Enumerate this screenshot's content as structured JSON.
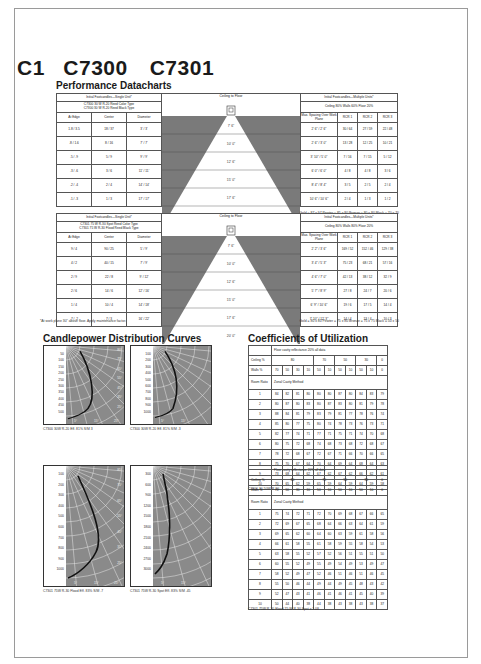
{
  "header": {
    "section": "C1",
    "model1": "C7300",
    "model2": "C7301"
  },
  "performance": {
    "title": "Performance Datacharts",
    "tables": [
      {
        "single_title": "Initial Footcandles—Single Unit*",
        "lamp_line1": "C7300  30 W R-20 Reed Color Type",
        "lamp_line2": "C7300  30 W R-20 Reed Black Type",
        "col_edge": "At Edge",
        "col_center": "Center",
        "col_diameter": "Diameter",
        "ceiling_title": "Ceiling to Floor",
        "multi_title": "Initial Footcandles—Multiple Units*",
        "multi_sub": "Ceiling 80%   Walls 60%   Floor 20%",
        "col_spacing": "Max. Spacing Over Work Plane",
        "col_rcr1": "RCR 1",
        "col_rcr2": "RCR 2",
        "col_rcr3": "RCR 3",
        "rows": [
          {
            "edge": "1.8 / 3.5",
            "center": "18 / 37",
            "diameter": "3' / 3'",
            "height": "7' 6\"",
            "spacing": "2' 6\" / 2' 6\"",
            "rcr1": "30 / 64",
            "rcr2": "27 / 59",
            "rcr3": "22 / 48"
          },
          {
            "edge": ".8 / 1.6",
            "center": "8 / 16",
            "diameter": "7' / 7'",
            "height": "10' 0\"",
            "spacing": "2' 6\" / 3' 0\"",
            "rcr1": "13 / 28",
            "rcr2": "12 / 25",
            "rcr3": "10 / 21"
          },
          {
            "edge": ".5 / .9",
            "center": "5 / 9",
            "diameter": "9' / 9'",
            "height": "12' 6\"",
            "spacing": "3' 10\" / 5' 0\"",
            "rcr1": "7 / 16",
            "rcr2": "7 / 15",
            "rcr3": "5 / 12"
          },
          {
            "edge": ".3 / .6",
            "center": "3 / 6",
            "diameter": "11' / 11'",
            "height": "15' 0\"",
            "spacing": "6' 0\" / 6' 0\"",
            "rcr1": "4 / 8",
            "rcr2": "4 / 8",
            "rcr3": "3 / 6"
          },
          {
            "edge": ".2 / .4",
            "center": "2 / 4",
            "diameter": "14' / 14'",
            "height": "17' 6\"",
            "spacing": "8' 4\" / 8' 4\"",
            "rcr1": "3 / 5",
            "rcr2": "2 / 5",
            "rcr3": "2 / 4"
          },
          {
            "edge": ".1 / .3",
            "center": "1 / 3",
            "diameter": "17' / 17'",
            "height": "20' 0\"",
            "spacing": "10' 6\" / 10' 6\"",
            "rcr1": "2 / 4",
            "rcr2": "1 / 3",
            "rcr3": "1 / 2"
          }
        ],
        "footnote_right": "Gold = 87 x 97   Pewter = 85 x 80   Bronze = 80 x 80   Black = 70 x 70"
      },
      {
        "single_title": "Initial Footcandles—Single Unit*",
        "lamp_line1": "C7301  75 W R-30 Spot Reed Color Type",
        "lamp_line2": "C7301  75 W R-30 Flood Reed Black Type",
        "col_edge": "At Edge",
        "col_center": "Center",
        "col_diameter": "Diameter",
        "ceiling_title": "Ceiling to Floor",
        "multi_title": "Initial Footcandles—Multiple Units*",
        "multi_sub": "Ceiling 80%   Walls 80%   Floor 20%",
        "col_spacing": "Max. Spacing Over Work Plane",
        "col_rcr1": "RCR 1",
        "col_rcr2": "RCR 2",
        "col_rcr3": "RCR 3",
        "rows": [
          {
            "edge": "9 / 4",
            "center": "90 / 25",
            "diameter": "5' / 9'",
            "height": "7' 6\"",
            "spacing": "2' 2\" / 3' 6\"",
            "rcr1": "169 / 52",
            "rcr2": "152 / 46",
            "rcr3": "129 / 38"
          },
          {
            "edge": "4 / 2",
            "center": "40 / 15",
            "diameter": "7' / 9'",
            "height": "10' 0\"",
            "spacing": "3' 4\" / 5' 3\"",
            "rcr1": "75 / 23",
            "rcr2": "68 / 21",
            "rcr3": "57 / 16"
          },
          {
            "edge": "2 / 9",
            "center": "22 / 8",
            "diameter": "9' / 12'",
            "height": "12' 6\"",
            "spacing": "4' 6\" / 7' 0\"",
            "rcr1": "42 / 13",
            "rcr2": "38 / 12",
            "rcr3": "32 / 9"
          },
          {
            "edge": "2 / 6",
            "center": "14 / 6",
            "diameter": "12' / 16'",
            "height": "15' 0\"",
            "spacing": "5' 7\" / 8' 9\"",
            "rcr1": "27 / 8",
            "rcr2": "24 / 7",
            "rcr3": "20 / 6"
          },
          {
            "edge": "1 / 4",
            "center": "10 / 4",
            "diameter": "14' / 18'",
            "height": "17' 6\"",
            "spacing": "6' 9\" / 10' 6\"",
            "rcr1": "19 / 6",
            "rcr2": "17 / 5",
            "rcr3": "14 / 4"
          },
          {
            "edge": ".7 / .2",
            "center": "7 / 3",
            "diameter": "16' / 22'",
            "height": "20' 0\"",
            "spacing": "7' 10\" / 12' 3\"",
            "rcr1": "14 / 4",
            "rcr2": "13 / 4",
            "rcr3": "10 / 3"
          }
        ],
        "footnote_left": "*At work plane 30\" above floor.  Apply maintenance factor.",
        "footnote_right": "Gold = 80 x 80   Pewter = 75 x 80   Bronze = 75 x 75   Black = 50 x 50"
      }
    ]
  },
  "candlepower": {
    "title": "Candlepower Distribution Curves",
    "charts": [
      {
        "ticks": [
          "50",
          "100",
          "150",
          "200",
          "250",
          "300",
          "350",
          "400",
          "450",
          "500"
        ],
        "caption": "C7300   30W R-20   Eff. 81%   S/M 3",
        "angles": [
          "80°",
          "75°",
          "65°",
          "55°",
          "45°",
          "35°",
          "25°"
        ],
        "bottom": [
          "5°",
          "15°",
          "25°"
        ]
      },
      {
        "ticks": [
          "100",
          "200",
          "300",
          "400",
          "500",
          "600",
          "700",
          "800",
          "900",
          "1000"
        ],
        "caption": "C7300   30W R-20   Eff. 81%   S/M .3",
        "angles": [],
        "bottom": [
          "5°",
          "15°"
        ]
      },
      {
        "ticks": [
          "100",
          "200",
          "300",
          "400",
          "500",
          "600",
          "700",
          "800",
          "900",
          "1000"
        ],
        "caption": "C7301   75W R-30 Flood   Eff. 83%   S/M .7",
        "angles": [
          "85°",
          "75°",
          "65°",
          "55°",
          "45°",
          "35°",
          "25°"
        ],
        "bottom": [
          "5°",
          "15°",
          "25°"
        ]
      },
      {
        "ticks": [
          "300",
          "600",
          "900",
          "1200",
          "1500",
          "1800",
          "2100",
          "2400",
          "2700",
          "3000"
        ],
        "caption": "C7301   75W R-30 Spot   Eff. 83%   S/M .45",
        "angles": [],
        "bottom": [
          "5°",
          "15°"
        ]
      }
    ]
  },
  "cou": {
    "title": "Coefficients of Utilization",
    "floor_note": "Floor cavity reflectance 20% all data",
    "ceiling_label": "Ceiling %",
    "walls_label": "Walls %",
    "room_ratio_label": "Room Ratio",
    "method_label": "Zonal Cavity Method",
    "ceiling_values": [
      "80",
      "70",
      "50",
      "30",
      "0"
    ],
    "walls_values": [
      "70",
      "50",
      "30",
      "10",
      "50",
      "10",
      "50",
      "10",
      "50",
      "10",
      "0"
    ],
    "tables": [
      {
        "rows": [
          [
            "1",
            "84",
            "82",
            "81",
            "80",
            "80",
            "80",
            "87",
            "80",
            "84",
            "83",
            "79"
          ],
          [
            "2",
            "80",
            "87",
            "80",
            "83",
            "80",
            "87",
            "83",
            "80",
            "81",
            "79",
            "78"
          ],
          [
            "3",
            "88",
            "84",
            "81",
            "79",
            "83",
            "79",
            "81",
            "77",
            "78",
            "76",
            "74"
          ],
          [
            "4",
            "85",
            "80",
            "77",
            "75",
            "80",
            "74",
            "78",
            "73",
            "76",
            "73",
            "71"
          ],
          [
            "5",
            "82",
            "77",
            "74",
            "71",
            "77",
            "71",
            "75",
            "71",
            "74",
            "70",
            "68"
          ],
          [
            "6",
            "80",
            "75",
            "72",
            "68",
            "74",
            "68",
            "73",
            "68",
            "72",
            "68",
            "67"
          ],
          [
            "7",
            "78",
            "72",
            "68",
            "67",
            "72",
            "67",
            "71",
            "66",
            "70",
            "66",
            "65"
          ],
          [
            "8",
            "75",
            "70",
            "67",
            "64",
            "70",
            "64",
            "69",
            "64",
            "68",
            "64",
            "63"
          ],
          [
            "9",
            "73",
            "68",
            "64",
            "62",
            "67",
            "62",
            "67",
            "62",
            "66",
            "62",
            "61"
          ],
          [
            "10",
            "70",
            "65",
            "62",
            "59",
            "65",
            "59",
            "64",
            "59",
            "64",
            "59",
            "58"
          ]
        ],
        "caption": "C7300   30-50W R-20"
      },
      {
        "rows": [
          [
            "1",
            "75",
            "74",
            "72",
            "71",
            "72",
            "70",
            "69",
            "68",
            "67",
            "66",
            "65"
          ],
          [
            "2",
            "72",
            "69",
            "67",
            "65",
            "68",
            "64",
            "66",
            "63",
            "64",
            "61",
            "59"
          ],
          [
            "3",
            "69",
            "65",
            "62",
            "60",
            "64",
            "60",
            "63",
            "59",
            "61",
            "58",
            "56"
          ],
          [
            "4",
            "66",
            "61",
            "58",
            "55",
            "61",
            "58",
            "59",
            "55",
            "58",
            "54",
            "53"
          ],
          [
            "5",
            "63",
            "58",
            "55",
            "52",
            "57",
            "52",
            "56",
            "51",
            "55",
            "51",
            "50"
          ],
          [
            "6",
            "60",
            "55",
            "52",
            "49",
            "55",
            "49",
            "54",
            "49",
            "53",
            "49",
            "47"
          ],
          [
            "7",
            "58",
            "52",
            "49",
            "47",
            "52",
            "46",
            "51",
            "46",
            "51",
            "46",
            "45"
          ],
          [
            "8",
            "55",
            "50",
            "46",
            "44",
            "49",
            "44",
            "49",
            "45",
            "48",
            "43",
            "42"
          ],
          [
            "9",
            "52",
            "47",
            "43",
            "41",
            "46",
            "41",
            "46",
            "41",
            "45",
            "40",
            "39"
          ],
          [
            "10",
            "50",
            "44",
            "40",
            "38",
            "44",
            "38",
            "43",
            "38",
            "43",
            "38",
            "37"
          ]
        ],
        "caption": "C7301   75W R-30 Flood          75 W R-30 Spot x 1.08"
      }
    ]
  }
}
